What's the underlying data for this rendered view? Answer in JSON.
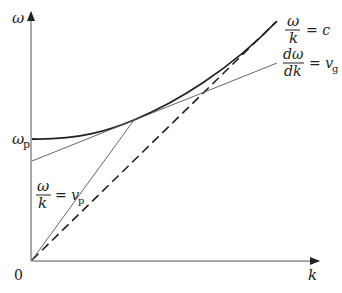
{
  "diagram": {
    "axes": {
      "y_label": "ω",
      "x_label": "k",
      "origin_label": "0",
      "y_intercept_label": "ω",
      "y_intercept_subscript": "p"
    },
    "labels": {
      "light_line": {
        "num": "ω",
        "den": "k",
        "eq": "= c"
      },
      "group_velocity": {
        "num": "dω",
        "den": "dk",
        "eq": "= v",
        "sub": "g"
      },
      "phase_velocity": {
        "num": "ω",
        "den": "k",
        "eq": "= v",
        "sub": "p"
      }
    },
    "colors": {
      "line": "#222222",
      "thin_line": "#555555",
      "background": "#ffffff"
    }
  }
}
